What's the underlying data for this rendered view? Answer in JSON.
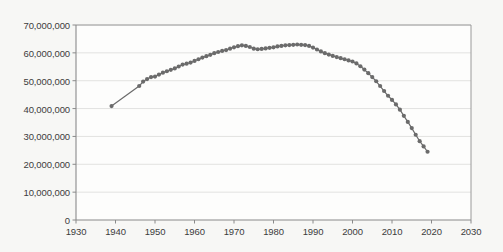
{
  "chart_data": {
    "type": "line",
    "title": "",
    "subtitle": "",
    "xlabel": "",
    "ylabel": "",
    "xlim": [
      1930,
      2030
    ],
    "ylim": [
      0,
      70000000
    ],
    "grid": true,
    "legend": false,
    "marker": "circle",
    "line_color": "#6b6b6b",
    "marker_color": "#6b6b6b",
    "grid_color": "#e2e2e0",
    "axis_color": "#9a9a9a",
    "background_color": "#f7f7f5",
    "plot_background_color": "#fdfdfc",
    "x_ticks": [
      1930,
      1940,
      1950,
      1960,
      1970,
      1980,
      1990,
      2000,
      2010,
      2020,
      2030
    ],
    "x_tick_labels": [
      "1930",
      "1940",
      "1950",
      "1960",
      "1970",
      "1980",
      "1990",
      "2000",
      "2010",
      "2020",
      "2030"
    ],
    "y_ticks": [
      0,
      10000000,
      20000000,
      30000000,
      40000000,
      50000000,
      60000000,
      70000000
    ],
    "y_tick_labels": [
      "0",
      "10,000,000",
      "20,000,000",
      "30,000,000",
      "40,000,000",
      "50,000,000",
      "60,000,000",
      "70,000,000"
    ],
    "series": [
      {
        "name": "series-1",
        "x": [
          1939,
          1946,
          1947,
          1948,
          1949,
          1950,
          1951,
          1952,
          1953,
          1954,
          1955,
          1956,
          1957,
          1958,
          1959,
          1960,
          1961,
          1962,
          1963,
          1964,
          1965,
          1966,
          1967,
          1968,
          1969,
          1970,
          1971,
          1972,
          1973,
          1974,
          1975,
          1976,
          1977,
          1978,
          1979,
          1980,
          1981,
          1982,
          1983,
          1984,
          1985,
          1986,
          1987,
          1988,
          1989,
          1990,
          1991,
          1992,
          1993,
          1994,
          1995,
          1996,
          1997,
          1998,
          1999,
          2000,
          2001,
          2002,
          2003,
          2004,
          2005,
          2006,
          2007,
          2008,
          2009,
          2010,
          2011,
          2012,
          2013,
          2014,
          2015,
          2016,
          2017,
          2018,
          2019
        ],
        "y": [
          40900000,
          48100000,
          49700000,
          50600000,
          51300000,
          51500000,
          52200000,
          52900000,
          53400000,
          53900000,
          54400000,
          55100000,
          55800000,
          56100000,
          56500000,
          57100000,
          57700000,
          58300000,
          58800000,
          59300000,
          59900000,
          60300000,
          60700000,
          61000000,
          61500000,
          62000000,
          62400000,
          62700000,
          62500000,
          62100000,
          61500000,
          61300000,
          61400000,
          61600000,
          61800000,
          62000000,
          62300000,
          62500000,
          62700000,
          62800000,
          62900000,
          63000000,
          62900000,
          62800000,
          62500000,
          61900000,
          61200000,
          60500000,
          59900000,
          59400000,
          58900000,
          58500000,
          58100000,
          57700000,
          57300000,
          56900000,
          56200000,
          55200000,
          54000000,
          52700000,
          51300000,
          49800000,
          48100000,
          46300000,
          44600000,
          43100000,
          41500000,
          39600000,
          37400000,
          35200000,
          33000000,
          30600000,
          28300000,
          26400000,
          24500000
        ]
      }
    ]
  }
}
